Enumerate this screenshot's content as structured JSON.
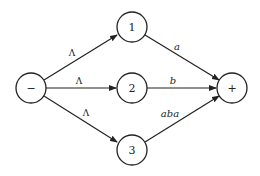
{
  "diagram": {
    "type": "state-transition-graph",
    "nodes": [
      {
        "id": "start",
        "label": "−",
        "cx": 31,
        "cy": 88
      },
      {
        "id": "n1",
        "label": "1",
        "cx": 132,
        "cy": 27
      },
      {
        "id": "n2",
        "label": "2",
        "cx": 132,
        "cy": 88
      },
      {
        "id": "n3",
        "label": "3",
        "cx": 132,
        "cy": 150
      },
      {
        "id": "end",
        "label": "+",
        "cx": 232,
        "cy": 88
      }
    ],
    "edges": [
      {
        "from": "start",
        "to": "n1",
        "label": "Λ"
      },
      {
        "from": "start",
        "to": "n2",
        "label": "Λ"
      },
      {
        "from": "start",
        "to": "n3",
        "label": "Λ"
      },
      {
        "from": "n1",
        "to": "end",
        "label": "a"
      },
      {
        "from": "n2",
        "to": "end",
        "label": "b"
      },
      {
        "from": "n3",
        "to": "end",
        "label": "aba"
      }
    ]
  }
}
